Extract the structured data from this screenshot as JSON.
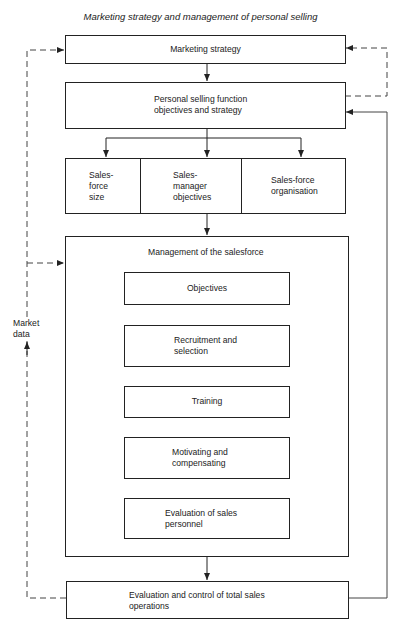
{
  "title": "Marketing strategy and management of personal selling",
  "boxes": {
    "marketing_strategy": "Marketing strategy",
    "personal_selling_1": "Personal selling function",
    "personal_selling_2": "objectives and strategy",
    "salesforce_size_1": "Sales-",
    "salesforce_size_2": "force",
    "salesforce_size_3": "size",
    "sales_manager_1": "Sales-",
    "sales_manager_2": "manager",
    "sales_manager_3": "objectives",
    "salesforce_org_1": "Sales-force",
    "salesforce_org_2": "organisation",
    "management": "Management of the salesforce",
    "objectives": "Objectives",
    "recruitment_1": "Recruitment and",
    "recruitment_2": "selection",
    "training": "Training",
    "motivating_1": "Motivating and",
    "motivating_2": "compensating",
    "evaluation_personnel_1": "Evaluation of sales",
    "evaluation_personnel_2": "personnel",
    "evaluation_total_1": "Evaluation and control of total sales",
    "evaluation_total_2": "operations"
  },
  "labels": {
    "market_data_1": "Market",
    "market_data_2": "data"
  },
  "colors": {
    "line": "#222222",
    "background": "#ffffff"
  }
}
